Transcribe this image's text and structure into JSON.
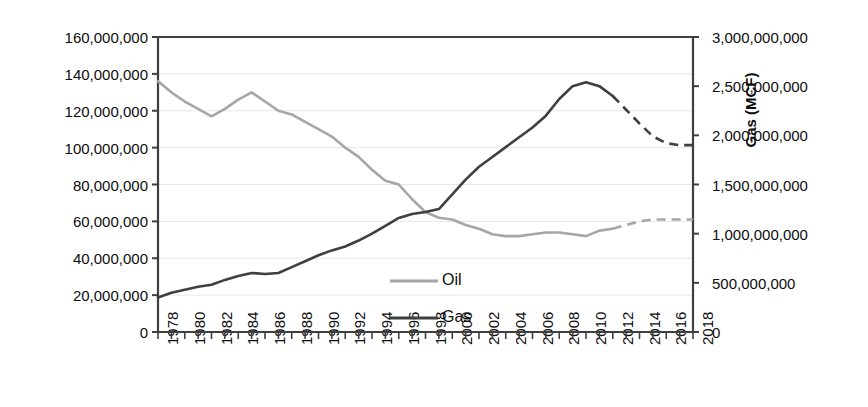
{
  "chart_data": {
    "type": "line",
    "title": "",
    "xlabel": "",
    "x": [
      1978,
      1979,
      1980,
      1981,
      1982,
      1983,
      1984,
      1985,
      1986,
      1987,
      1988,
      1989,
      1990,
      1991,
      1992,
      1993,
      1994,
      1995,
      1996,
      1997,
      1998,
      1999,
      2000,
      2001,
      2002,
      2003,
      2004,
      2005,
      2006,
      2007,
      2008,
      2009,
      2010,
      2011,
      2012,
      2013,
      2014,
      2015,
      2016,
      2017,
      2018
    ],
    "xlim": [
      1978,
      2018
    ],
    "xtick_labels": [
      "1978",
      "1980",
      "1982",
      "1984",
      "1986",
      "1988",
      "1990",
      "1992",
      "1994",
      "1996",
      "1998",
      "2000",
      "2002",
      "2004",
      "2006",
      "2008",
      "2010",
      "2012",
      "2014",
      "2016",
      "2018"
    ],
    "xtick_step": 2,
    "grid": true,
    "legend_position": "inside-center-lower",
    "forecast_start_year": 2012,
    "series": [
      {
        "name": "Oil",
        "axis": "left",
        "units": "barrels",
        "color": "#a6a6a6",
        "values": [
          136000000,
          130000000,
          125000000,
          121000000,
          117000000,
          121000000,
          126000000,
          130000000,
          125000000,
          120000000,
          118000000,
          114000000,
          110000000,
          106000000,
          100000000,
          95000000,
          88000000,
          82000000,
          80000000,
          72000000,
          65000000,
          62000000,
          61000000,
          58000000,
          56000000,
          53000000,
          52000000,
          52000000,
          53000000,
          54000000,
          54000000,
          53000000,
          52000000,
          55000000,
          56000000,
          58000000,
          60000000,
          61000000,
          61000000,
          61000000,
          61000000
        ]
      },
      {
        "name": "Gas",
        "axis": "right",
        "units": "MCF",
        "color": "#3f3f3f",
        "values": [
          350000000,
          400000000,
          430000000,
          460000000,
          480000000,
          530000000,
          570000000,
          600000000,
          590000000,
          600000000,
          660000000,
          720000000,
          780000000,
          830000000,
          870000000,
          930000000,
          1000000000,
          1080000000,
          1160000000,
          1200000000,
          1220000000,
          1250000000,
          1400000000,
          1550000000,
          1680000000,
          1780000000,
          1880000000,
          1980000000,
          2080000000,
          2200000000,
          2370000000,
          2500000000,
          2540000000,
          2500000000,
          2400000000,
          2260000000,
          2120000000,
          1990000000,
          1920000000,
          1900000000,
          1900000000
        ]
      }
    ],
    "axes": {
      "left": {
        "label": "Oil (barrels)",
        "ylim": [
          0,
          160000000
        ],
        "tick_step": 20000000,
        "tick_labels": [
          "0",
          "20,000,000",
          "40,000,000",
          "60,000,000",
          "80,000,000",
          "100,000,000",
          "120,000,000",
          "140,000,000",
          "160,000,000"
        ]
      },
      "right": {
        "label": "Gas (MCF)",
        "ylim": [
          0,
          3000000000
        ],
        "tick_step": 500000000,
        "tick_labels": [
          "0",
          "500,000,000",
          "1,000,000,000",
          "1,500,000,000",
          "2,000,000,000",
          "2,500,000,000",
          "3,000,000,000"
        ]
      }
    },
    "legend": [
      {
        "label": "Oil",
        "color": "#a6a6a6"
      },
      {
        "label": "Gas",
        "color": "#3f3f3f"
      }
    ]
  },
  "colors": {
    "oil": "#a6a6a6",
    "gas": "#3f3f3f",
    "axis": "#3f3f3f",
    "grid": "#e8e8ec",
    "text": "#0d0d0d",
    "background": "#ffffff"
  }
}
